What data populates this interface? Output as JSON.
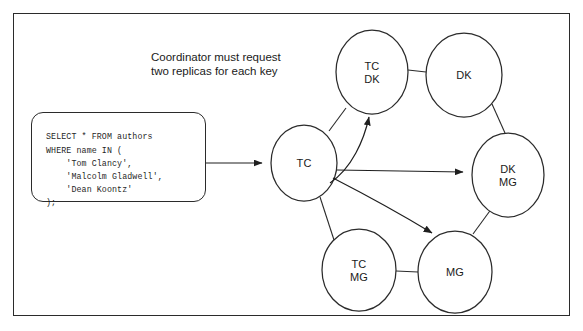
{
  "figure": {
    "border_color": "#2b2b2b",
    "background": "#ffffff"
  },
  "caption": {
    "text": "Coordinator must request\ntwo replicas for each key"
  },
  "sql_box": {
    "code": "SELECT * FROM authors\nWHERE name IN (\n    'Tom Clancy',\n    'Malcolm Gladwell',\n    'Dean Koontz'\n);"
  },
  "nodes": [
    {
      "id": "tc",
      "label": "TC",
      "cx": 304,
      "cy": 163,
      "rx": 33,
      "ry": 38
    },
    {
      "id": "tcdk",
      "label": "TC\nDK",
      "cx": 372,
      "cy": 72,
      "rx": 36,
      "ry": 42
    },
    {
      "id": "dk",
      "label": "DK",
      "cx": 464,
      "cy": 75,
      "rx": 38,
      "ry": 42
    },
    {
      "id": "dkmg",
      "label": "DK\nMG",
      "cx": 508,
      "cy": 175,
      "rx": 36,
      "ry": 42
    },
    {
      "id": "mg",
      "label": "MG",
      "cx": 455,
      "cy": 272,
      "rx": 37,
      "ry": 41
    },
    {
      "id": "tcmg",
      "label": "TC\nMG",
      "cx": 359,
      "cy": 270,
      "rx": 37,
      "ry": 41
    }
  ],
  "edges": [
    {
      "id": "tc-tcdk-link",
      "type": "ring-link"
    },
    {
      "id": "tcdk-dk-link",
      "type": "ring-link"
    },
    {
      "id": "dk-dkmg-link",
      "type": "ring-link"
    },
    {
      "id": "dkmg-mg-link",
      "type": "ring-link"
    },
    {
      "id": "mg-tcmg-link",
      "type": "ring-link"
    },
    {
      "id": "tcmg-tc-link",
      "type": "ring-link"
    }
  ],
  "arrows": [
    {
      "id": "query-to-tc",
      "type": "straight",
      "from": "sql-box",
      "to": "tc"
    },
    {
      "id": "tc-to-tcdk",
      "type": "curved",
      "from": "tc",
      "to": "tcdk"
    },
    {
      "id": "tc-to-dkmg",
      "type": "straight",
      "from": "tc",
      "to": "dkmg"
    },
    {
      "id": "tc-to-mg",
      "type": "curved",
      "from": "tc",
      "to": "mg"
    }
  ],
  "colors": {
    "stroke": "#2b2b2b",
    "text": "#1a1a1a",
    "code_text": "#1f1f1f"
  }
}
